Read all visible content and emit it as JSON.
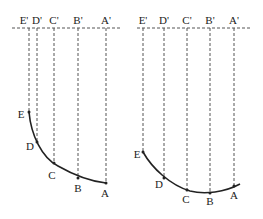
{
  "left_panel": {
    "top_labels": [
      "E'",
      "D'",
      "C'",
      "B'",
      "A'"
    ],
    "curve_labels": [
      "E",
      "D",
      "C",
      "B",
      "A"
    ]
  },
  "right_panel": {
    "top_labels": [
      "E'",
      "D'",
      "C'",
      "B'",
      "A'"
    ],
    "curve_labels": [
      "E",
      "D",
      "C",
      "B",
      "A"
    ]
  },
  "colors": {
    "line": "#222222",
    "dashed": "#555555"
  }
}
